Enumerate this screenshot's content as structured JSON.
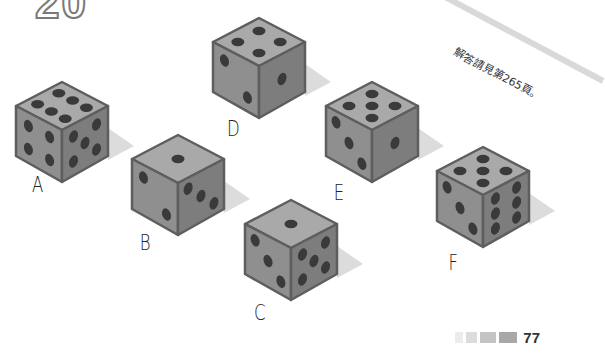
{
  "header": {
    "puzzle_number": "20"
  },
  "answer_note": "解答請見第265頁。",
  "dice": [
    {
      "label": "A",
      "x": 12,
      "y": 80,
      "top": 6,
      "left": 4,
      "right": 5,
      "label_x": 30,
      "label_y": 172
    },
    {
      "label": "B",
      "x": 128,
      "y": 133,
      "top": 1,
      "left": 2,
      "right": 3,
      "label_x": 138,
      "label_y": 230
    },
    {
      "label": "C",
      "x": 241,
      "y": 198,
      "top": 1,
      "left": 3,
      "right": 5,
      "label_x": 252,
      "label_y": 300
    },
    {
      "label": "D",
      "x": 209,
      "y": 16,
      "top": 4,
      "left": 2,
      "right": 1,
      "label_x": 225,
      "label_y": 116
    },
    {
      "label": "E",
      "x": 322,
      "y": 80,
      "top": 5,
      "left": 3,
      "right": 1,
      "label_x": 332,
      "label_y": 180
    },
    {
      "label": "F",
      "x": 433,
      "y": 145,
      "top": 5,
      "left": 3,
      "right": 6,
      "label_x": 447,
      "label_y": 250
    }
  ],
  "colors": {
    "top": "#a9a9a9",
    "left": "#8f8f8f",
    "right": "#7d7d7d",
    "edge": "#5e5e5e",
    "pip": "#3a3a3a",
    "shadow": "#dcdcdc"
  },
  "footer": {
    "page_number": "77",
    "squares": [
      "#ececec",
      "#dcdcdc",
      "#c4c4c4",
      "#a8a8a8"
    ]
  }
}
